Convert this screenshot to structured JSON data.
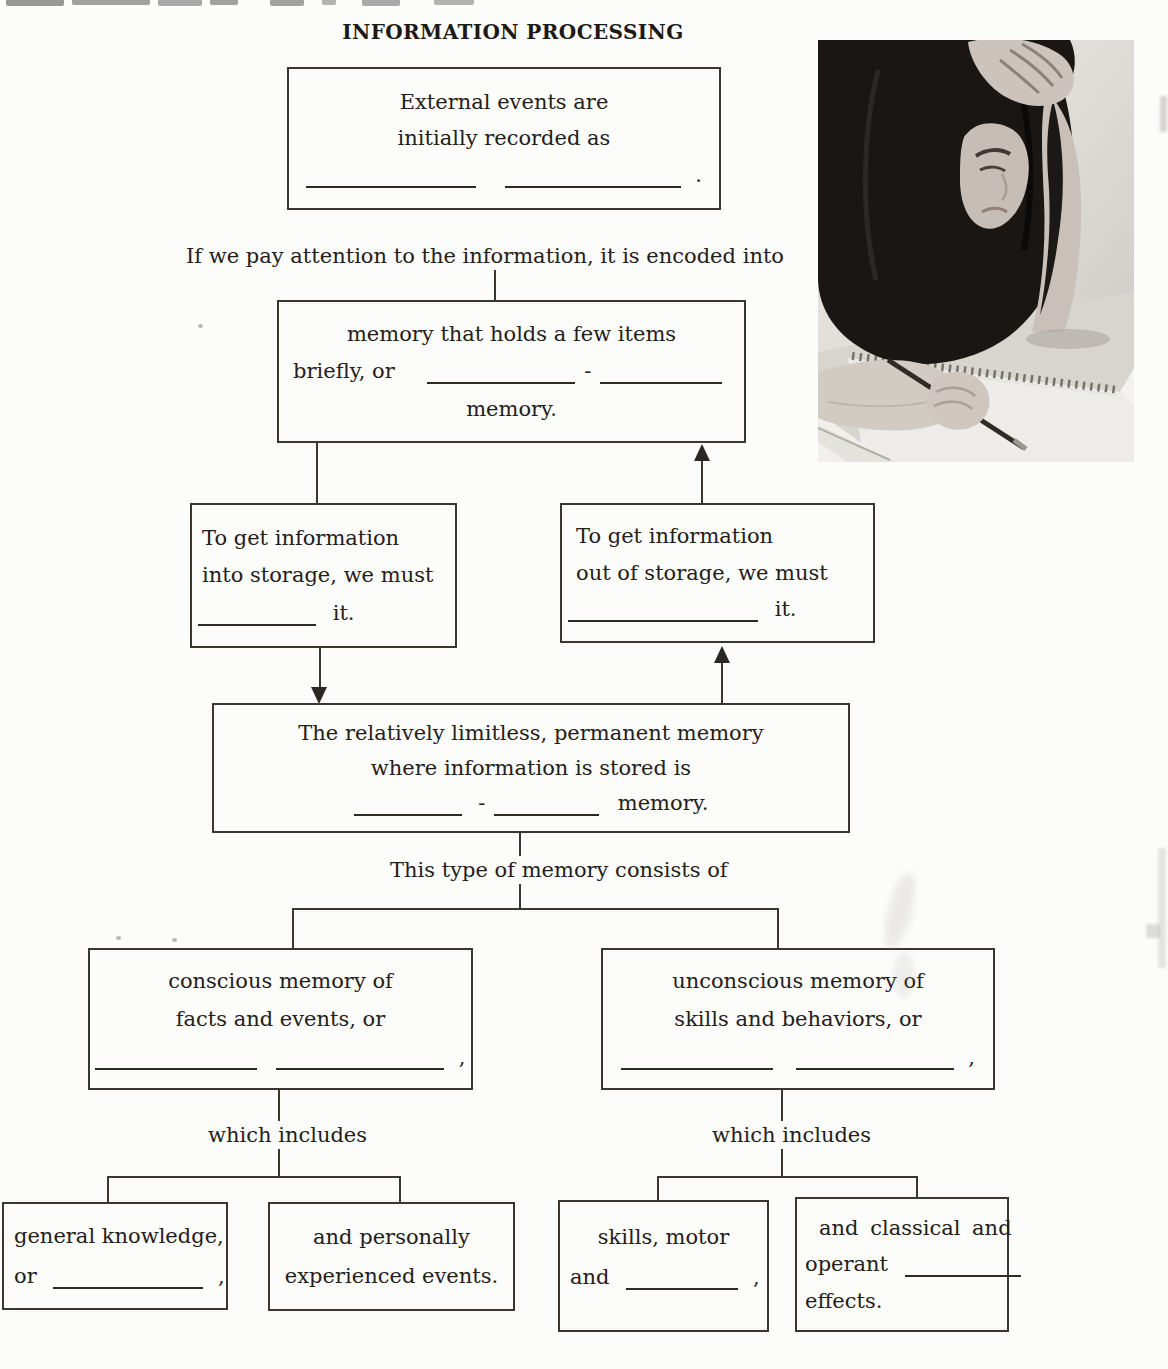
{
  "page": {
    "title": "INFORMATION PROCESSING",
    "attention_line": "If we pay attention to the information, it is encoded into",
    "consists_line": "This type of memory consists of",
    "which_includes_left": "which includes",
    "which_includes_right": "which includes"
  },
  "colors": {
    "ink": "#242019",
    "box_border": "#3a3733",
    "page_background": "#fcfcfb"
  },
  "photo": {
    "name": "student-studying-photo",
    "description": "grayscale photo of a woman with long dark hair, hand on head, writing in a spiral notebook"
  },
  "boxes": {
    "sensory": {
      "line1": "External events are",
      "line2": "initially recorded as",
      "period": "."
    },
    "short_term": {
      "line1": "memory that holds a few items",
      "prefix": "briefly, or",
      "hyphen": "-",
      "line3": "memory."
    },
    "encode": {
      "line1": "To get information",
      "line2": "into storage, we must",
      "suffix": "it."
    },
    "retrieve": {
      "line1": "To get information",
      "line2": "out of storage, we must",
      "suffix": "it."
    },
    "long_term": {
      "line1": "The relatively limitless, permanent memory",
      "line2": "where information is stored is",
      "hyphen": "-",
      "suffix": "memory."
    },
    "explicit": {
      "line1": "conscious memory of",
      "line2": "facts and events, or",
      "comma": ","
    },
    "implicit": {
      "line1": "unconscious memory of",
      "line2": "skills and behaviors, or",
      "comma": ","
    },
    "semantic": {
      "line1": "general knowledge,",
      "prefix": "or",
      "comma": ","
    },
    "episodic": {
      "line1": "and personally",
      "line2": "experienced events."
    },
    "procedural": {
      "line1": "skills, motor",
      "prefix": "and",
      "comma": ","
    },
    "conditioning": {
      "line1": "and classical and",
      "prefix": "operant",
      "line3": "effects."
    }
  }
}
